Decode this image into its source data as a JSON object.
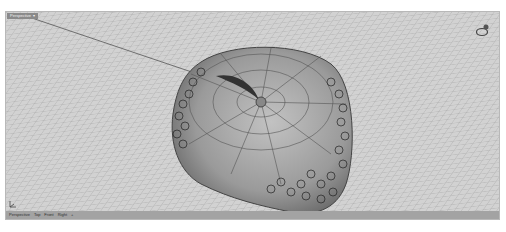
{
  "viewport": {
    "title": "Perspective",
    "dropdown_icon": "triangle-down",
    "display_mode": "shaded",
    "background_color": "#cfcfcf",
    "grid_color": "#a9a9a9",
    "model": {
      "description": "Apple-shaped surface with stem, leaf and clusters of small circular ornaments",
      "surface_color": "#9a9a9a"
    }
  },
  "tabs": [
    {
      "label": "Perspective",
      "active": true
    },
    {
      "label": "Top",
      "active": false
    },
    {
      "label": "Front",
      "active": false
    },
    {
      "label": "Right",
      "active": false
    },
    {
      "label": "+",
      "active": false
    }
  ],
  "icons": {
    "gumball": "orbit-rotate-icon",
    "world_axes": "world-axis-icon"
  }
}
